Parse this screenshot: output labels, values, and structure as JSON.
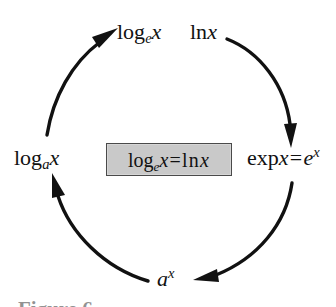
{
  "figure": {
    "type": "cycle-diagram",
    "background_color": "#ffffff",
    "stroke_color": "#111111",
    "caption_partial": "Figure 6",
    "labels": {
      "top_left": {
        "name": "log-base-e-of-x",
        "op": "log",
        "base": "e",
        "arg": "x",
        "plain": "log_e x"
      },
      "top_right": {
        "name": "natural-log-of-x",
        "op": "ln",
        "arg": "x",
        "plain": "ln x"
      },
      "left": {
        "name": "log-base-a-of-x",
        "op": "log",
        "base": "a",
        "arg": "x",
        "plain": "log_a x"
      },
      "right": {
        "name": "exp-x-equals-e-to-the-x",
        "op": "exp",
        "arg": "x",
        "equals": "=",
        "rhs_base": "e",
        "rhs_exponent": "x",
        "plain": "exp x = e^x"
      },
      "bottom": {
        "name": "a-to-the-x",
        "base": "a",
        "exponent": "x",
        "plain": "a^x"
      }
    },
    "identity_box": {
      "name": "identity-log-e-equals-ln",
      "fill_color": "#c9c9c9",
      "border_color": "#4a4a4a",
      "lhs_op": "log",
      "lhs_base": "e",
      "lhs_arg": "x",
      "equals": "=",
      "rhs_op": "ln",
      "rhs_arg": "x",
      "plain": "log_e x = ln x"
    },
    "arcs": [
      {
        "name": "arc-ln-x-to-exp-x",
        "from": "ln x",
        "to": "exp x = e^x",
        "direction": "clockwise",
        "arrowhead": "down"
      },
      {
        "name": "arc-exp-x-to-a-to-the-x",
        "from": "exp x = e^x",
        "to": "a^x",
        "direction": "clockwise",
        "arrowhead": "left"
      },
      {
        "name": "arc-a-to-the-x-to-log-a-x",
        "from": "a^x",
        "to": "log_a x",
        "direction": "clockwise",
        "arrowhead": "up"
      },
      {
        "name": "arc-log-a-x-to-log-e-x",
        "from": "log_a x",
        "to": "log_e x",
        "direction": "clockwise",
        "arrowhead": "up-right"
      }
    ]
  }
}
